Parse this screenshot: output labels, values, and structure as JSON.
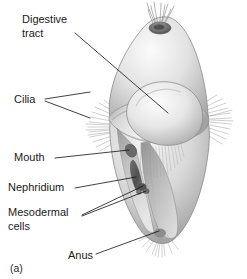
{
  "figure": {
    "panel_letter": "(a)",
    "organism": "trochophore-larva",
    "background_color": "#ffffff",
    "ink_color": "#111111",
    "body_fill_light": "#f2f2f2",
    "body_fill_mid": "#cfcfcf",
    "body_fill_dark": "#9a9a9a",
    "cilia_color": "#8c8c8c"
  },
  "labels": [
    {
      "id": "digestive-tract",
      "text_line1": "Digestive",
      "text_line2": "tract",
      "x": 22,
      "y": 18
    },
    {
      "id": "cilia",
      "text_line1": "Cilia",
      "text_line2": "",
      "x": 14,
      "y": 99
    },
    {
      "id": "mouth",
      "text_line1": "Mouth",
      "text_line2": "",
      "x": 14,
      "y": 158
    },
    {
      "id": "nephridium",
      "text_line1": "Nephridium",
      "text_line2": "",
      "x": 8,
      "y": 188
    },
    {
      "id": "mesodermal-cells",
      "text_line1": "Mesodermal",
      "text_line2": "cells",
      "x": 8,
      "y": 213
    },
    {
      "id": "anus",
      "text_line1": "Anus",
      "text_line2": "",
      "x": 68,
      "y": 256
    }
  ]
}
